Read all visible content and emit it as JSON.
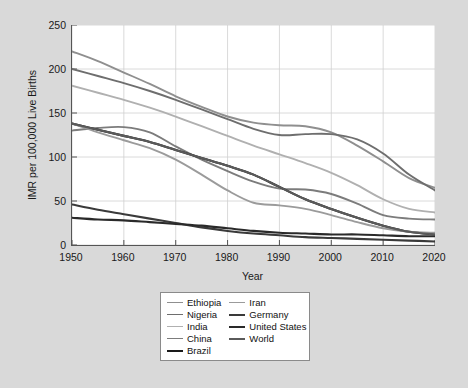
{
  "chart_data": {
    "type": "line",
    "title": "",
    "xlabel": "Year",
    "ylabel": "IMR per 100,000 Live Births",
    "xlim": [
      1950,
      2020
    ],
    "ylim": [
      0,
      250
    ],
    "xticks": [
      "1950",
      "1960",
      "1970",
      "1980",
      "1990",
      "2000",
      "2010",
      "2020"
    ],
    "yticks": [
      "0",
      "50",
      "100",
      "150",
      "200",
      "250"
    ],
    "grid": true,
    "legend_position": "below-center",
    "x": [
      1950,
      1955,
      1960,
      1965,
      1970,
      1975,
      1980,
      1985,
      1990,
      1995,
      2000,
      2005,
      2010,
      2015,
      2020
    ],
    "series": [
      {
        "name": "Ethiopia",
        "color": "#8f8f8f",
        "width": 1.9,
        "values": [
          220,
          209,
          196,
          183,
          169,
          157,
          146,
          139,
          136,
          135,
          128,
          113,
          95,
          76,
          65
        ]
      },
      {
        "name": "Nigeria",
        "color": "#6e6e6e",
        "width": 1.9,
        "values": [
          200,
          192,
          184,
          175,
          165,
          154,
          143,
          132,
          125,
          126,
          126,
          120,
          104,
          80,
          62
        ]
      },
      {
        "name": "India",
        "color": "#b0b0b0",
        "width": 1.9,
        "values": [
          181,
          173,
          165,
          156,
          146,
          135,
          124,
          113,
          103,
          93,
          82,
          68,
          52,
          41,
          37
        ]
      },
      {
        "name": "China",
        "color": "#7c7c7c",
        "width": 1.9,
        "values": [
          130,
          133,
          134,
          128,
          112,
          97,
          84,
          72,
          64,
          63,
          58,
          47,
          34,
          30,
          29
        ]
      },
      {
        "name": "Brazil",
        "color": "#1a1a1a",
        "width": 2.1,
        "values": [
          138,
          131,
          124,
          117,
          108,
          99,
          90,
          80,
          66,
          52,
          41,
          31,
          22,
          15,
          12
        ]
      },
      {
        "name": "Iran",
        "color": "#9b9b9b",
        "width": 1.9,
        "values": [
          138,
          128,
          119,
          110,
          97,
          80,
          62,
          48,
          45,
          41,
          34,
          26,
          19,
          15,
          14
        ]
      },
      {
        "name": "Germany",
        "color": "#3a3a3a",
        "width": 2.1,
        "values": [
          46,
          40,
          35,
          30,
          25,
          20,
          16,
          13,
          11,
          9,
          8,
          7,
          6,
          5,
          4
        ]
      },
      {
        "name": "United States",
        "color": "#2a2a2a",
        "width": 2.1,
        "values": [
          31,
          29,
          28,
          26,
          24,
          22,
          19,
          16,
          14,
          13,
          12,
          12,
          11,
          10,
          10
        ]
      },
      {
        "name": "World",
        "color": "#5a5a5a",
        "width": 2.1,
        "values": [
          138,
          131,
          124,
          117,
          108,
          99,
          90,
          80,
          66,
          52,
          41,
          31,
          22,
          15,
          12
        ]
      }
    ],
    "legend": [
      {
        "label": "Ethiopia",
        "color": "#8f8f8f",
        "width": 1.9
      },
      {
        "label": "Nigeria",
        "color": "#6e6e6e",
        "width": 1.9
      },
      {
        "label": "India",
        "color": "#b0b0b0",
        "width": 1.9
      },
      {
        "label": "China",
        "color": "#7c7c7c",
        "width": 1.9
      },
      {
        "label": "Brazil",
        "color": "#1a1a1a",
        "width": 2.3
      },
      {
        "label": "Iran",
        "color": "#9b9b9b",
        "width": 1.9
      },
      {
        "label": "Germany",
        "color": "#3a3a3a",
        "width": 2.3
      },
      {
        "label": "United States",
        "color": "#2a2a2a",
        "width": 2.3
      },
      {
        "label": "World",
        "color": "#5a5a5a",
        "width": 2.3
      }
    ],
    "legend_columns": [
      [
        "Ethiopia",
        "Nigeria",
        "India",
        "China",
        "Brazil"
      ],
      [
        "Iran",
        "Germany",
        "United States",
        "World"
      ]
    ],
    "colors": {
      "figure_background": "#d9d9d9",
      "plot_background": "#ffffff",
      "grid": "#d0d0d0",
      "axis": "#555555",
      "text": "#1a1a1a"
    }
  }
}
